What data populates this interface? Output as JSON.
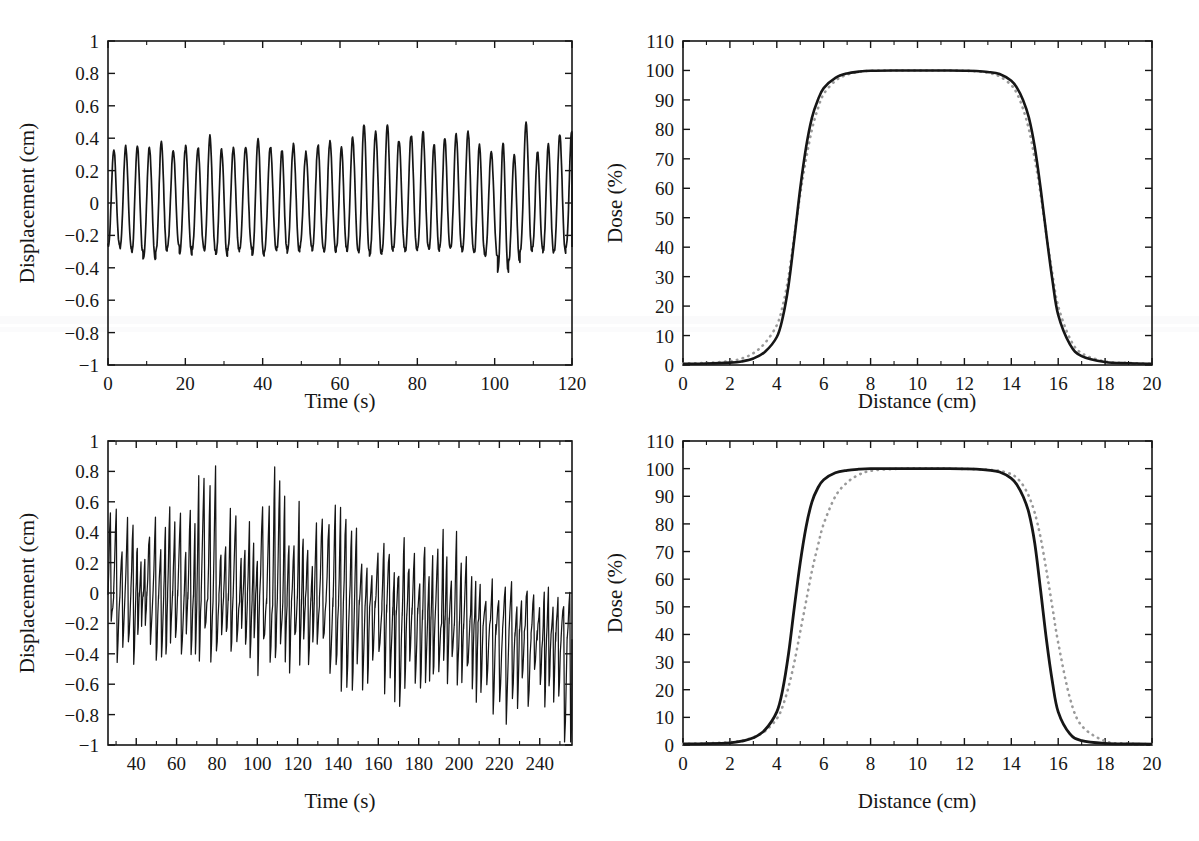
{
  "figure": {
    "background": "#ffffff",
    "ink": "#161616",
    "dotted_color": "#9a9a9a",
    "panel_count": 4
  },
  "panels": [
    {
      "id": "top-left",
      "name": "regular-breathing-trace",
      "chart_data": {
        "type": "line",
        "title": "",
        "xlabel": "Time (s)",
        "ylabel": "Displacement (cm)",
        "xlim": [
          0,
          120
        ],
        "ylim": [
          -1,
          1
        ],
        "xticks": [
          0,
          20,
          40,
          60,
          80,
          100,
          120
        ],
        "xticklabels": [
          "0",
          "20",
          "40",
          "60",
          "80",
          "100",
          "120"
        ],
        "yticks": [
          -1,
          -0.8,
          -0.6,
          -0.4,
          -0.2,
          0,
          0.2,
          0.4,
          0.6,
          0.8,
          1
        ],
        "yticklabels": [
          "−1",
          "−0.8",
          "−0.6",
          "−0.4",
          "−0.2",
          "0",
          "0.2",
          "0.4",
          "0.6",
          "0.8",
          "1"
        ],
        "minor_x_ticks": [
          10,
          30,
          50,
          70,
          90,
          110
        ],
        "grid": false,
        "legend": "none",
        "series": [
          {
            "name": "regular respiratory displacement",
            "style": "solid",
            "color": "#161616",
            "description": "Quasi-periodic breathing waveform, ~35 cycles over 120 s (period approx 3.4 s), sharp positive peaks and broad flat-bottomed troughs.",
            "peak_amplitudes": [
              0.33,
              0.35,
              0.36,
              0.34,
              0.38,
              0.33,
              0.35,
              0.34,
              0.41,
              0.33,
              0.34,
              0.35,
              0.39,
              0.35,
              0.33,
              0.36,
              0.31,
              0.36,
              0.38,
              0.35,
              0.4,
              0.49,
              0.44,
              0.49,
              0.39,
              0.42,
              0.44,
              0.36,
              0.4,
              0.42,
              0.44,
              0.36,
              0.31,
              0.37,
              0.3,
              0.49,
              0.32,
              0.36,
              0.42,
              0.45
            ],
            "trough_amplitudes": [
              -0.26,
              -0.28,
              -0.3,
              -0.35,
              -0.3,
              -0.27,
              -0.31,
              -0.28,
              -0.3,
              -0.32,
              -0.29,
              -0.28,
              -0.33,
              -0.3,
              -0.28,
              -0.3,
              -0.27,
              -0.29,
              -0.3,
              -0.28,
              -0.29,
              -0.3,
              -0.32,
              -0.3,
              -0.28,
              -0.3,
              -0.28,
              -0.29,
              -0.27,
              -0.28,
              -0.3,
              -0.31,
              -0.33,
              -0.42,
              -0.36,
              -0.3,
              -0.28,
              -0.3,
              -0.3,
              -0.28
            ],
            "mean_level": -0.05,
            "max": 0.49,
            "min": -0.42
          }
        ]
      }
    },
    {
      "id": "top-right",
      "name": "dose-profile-regular",
      "chart_data": {
        "type": "line",
        "title": "",
        "xlabel": "Distance (cm)",
        "ylabel": "Dose (%)",
        "xlim": [
          0,
          20
        ],
        "ylim": [
          0,
          110
        ],
        "xticks": [
          0,
          2,
          4,
          6,
          8,
          10,
          12,
          14,
          16,
          18,
          20
        ],
        "xticklabels": [
          "0",
          "2",
          "4",
          "6",
          "8",
          "10",
          "12",
          "14",
          "16",
          "18",
          "20"
        ],
        "yticks": [
          0,
          10,
          20,
          30,
          40,
          50,
          60,
          70,
          80,
          90,
          100,
          110
        ],
        "yticklabels": [
          "0",
          "10",
          "20",
          "30",
          "40",
          "50",
          "60",
          "70",
          "80",
          "90",
          "100",
          "110"
        ],
        "minor_x_ticks": [
          1,
          3,
          5,
          7,
          9,
          11,
          13,
          15,
          17,
          19
        ],
        "grid": false,
        "legend": "none",
        "x": [
          0,
          1,
          2,
          2.5,
          3,
          3.5,
          4,
          4.25,
          4.5,
          4.75,
          5,
          5.25,
          5.5,
          5.75,
          6,
          6.5,
          7,
          7.5,
          8,
          9,
          10,
          11,
          12,
          12.5,
          13,
          13.5,
          14,
          14.25,
          14.5,
          14.75,
          15,
          15.25,
          15.5,
          15.75,
          16,
          16.5,
          17,
          18,
          19,
          20
        ],
        "series": [
          {
            "name": "static dose profile",
            "style": "solid",
            "color": "#161616",
            "values": [
              0.4,
              0.5,
              0.8,
              1.2,
              2.2,
              4.5,
              9.5,
              16,
              27,
              43,
              60,
              74,
              84,
              90,
              94,
              97.5,
              99,
              99.6,
              99.9,
              100,
              100,
              100,
              99.9,
              99.8,
              99.5,
              98.8,
              96.5,
              94,
              90,
              84,
              74,
              60,
              44,
              29,
              17,
              7,
              3,
              1,
              0.6,
              0.4
            ]
          },
          {
            "name": "motion-convolved dose profile",
            "style": "dotted",
            "color": "#9a9a9a",
            "description": "Dotted curve nearly coincident with the solid curve; slightly wider penumbra on both sides.",
            "values": [
              0.5,
              0.7,
              1.3,
              2.2,
              4.0,
              7.5,
              13.5,
              20,
              30,
              44,
              58,
              70,
              80,
              87,
              92,
              96.5,
              98.6,
              99.5,
              99.9,
              100,
              100,
              100,
              99.9,
              99.7,
              99.2,
              98.0,
              95.0,
              92,
              87,
              80,
              70,
              58,
              44,
              31,
              20,
              9,
              4,
              1.2,
              0.7,
              0.4
            ]
          }
        ]
      }
    },
    {
      "id": "bottom-left",
      "name": "irregular-breathing-trace",
      "chart_data": {
        "type": "line",
        "title": "",
        "xlabel": "Time (s)",
        "ylabel": "Displacement (cm)",
        "xlim": [
          26,
          256
        ],
        "ylim": [
          -1,
          1
        ],
        "xticks": [
          40,
          60,
          80,
          100,
          120,
          140,
          160,
          180,
          200,
          220,
          240,
          260
        ],
        "xticklabels": [
          "40",
          "60",
          "80",
          "100",
          "120",
          "140",
          "160",
          "180",
          "200",
          "220",
          "240",
          "260"
        ],
        "yticks": [
          -1,
          -0.8,
          -0.6,
          -0.4,
          -0.2,
          0,
          0.2,
          0.4,
          0.6,
          0.8,
          1
        ],
        "yticklabels": [
          "−1",
          "−0.8",
          "−0.6",
          "−0.4",
          "−0.2",
          "0",
          "0.2",
          "0.4",
          "0.6",
          "0.8",
          "1"
        ],
        "minor_x_ticks": [
          30,
          50,
          70,
          90,
          110,
          130,
          150,
          170,
          190,
          210,
          230,
          250
        ],
        "grid": false,
        "legend": "none",
        "series": [
          {
            "name": "irregular respiratory displacement",
            "style": "solid",
            "color": "#161616",
            "description": "Highly irregular, dense high-frequency trace with strongly varying amplitude and a slow downward baseline drift after t~190 s.",
            "max": 0.87,
            "min": -0.75,
            "baseline_drift": [
              0.0,
              0.0,
              -0.02,
              -0.03,
              -0.05,
              -0.06,
              -0.08,
              -0.12,
              -0.18,
              -0.24,
              -0.28,
              -0.3
            ],
            "envelope_upper": [
              0.61,
              0.42,
              0.45,
              0.57,
              0.55,
              0.87,
              0.52,
              0.48,
              0.75,
              0.75,
              0.52,
              0.7,
              0.55,
              0.42,
              0.47,
              0.42,
              0.46,
              0.61,
              0.35,
              0.26,
              0.33,
              0.22,
              0.33,
              0.25
            ],
            "envelope_lower": [
              -0.43,
              -0.45,
              -0.41,
              -0.38,
              -0.41,
              -0.4,
              -0.49,
              -0.42,
              -0.44,
              -0.43,
              -0.47,
              -0.45,
              -0.56,
              -0.47,
              -0.56,
              -0.51,
              -0.44,
              -0.47,
              -0.58,
              -0.52,
              -0.53,
              -0.55,
              -0.61,
              -0.75
            ]
          }
        ]
      }
    },
    {
      "id": "bottom-right",
      "name": "dose-profile-irregular",
      "chart_data": {
        "type": "line",
        "title": "",
        "xlabel": "Distance (cm)",
        "ylabel": "Dose (%)",
        "xlim": [
          0,
          20
        ],
        "ylim": [
          0,
          110
        ],
        "xticks": [
          0,
          2,
          4,
          6,
          8,
          10,
          12,
          14,
          16,
          18,
          20
        ],
        "xticklabels": [
          "0",
          "2",
          "4",
          "6",
          "8",
          "10",
          "12",
          "14",
          "16",
          "18",
          "20"
        ],
        "yticks": [
          0,
          10,
          20,
          30,
          40,
          50,
          60,
          70,
          80,
          90,
          100,
          110
        ],
        "yticklabels": [
          "0",
          "10",
          "20",
          "30",
          "40",
          "50",
          "60",
          "70",
          "80",
          "90",
          "100",
          "110"
        ],
        "minor_x_ticks": [
          1,
          3,
          5,
          7,
          9,
          11,
          13,
          15,
          17,
          19
        ],
        "grid": false,
        "legend": "none",
        "x": [
          0,
          1,
          2,
          2.5,
          3,
          3.5,
          4,
          4.25,
          4.5,
          4.75,
          5,
          5.25,
          5.5,
          5.75,
          6,
          6.5,
          7,
          7.5,
          8,
          9,
          10,
          11,
          12,
          12.5,
          13,
          13.5,
          14,
          14.25,
          14.5,
          14.75,
          15,
          15.25,
          15.5,
          15.75,
          16,
          16.5,
          17,
          18,
          19,
          20
        ],
        "series": [
          {
            "name": "static dose profile",
            "style": "solid",
            "color": "#161616",
            "values": [
              0.4,
              0.5,
              0.8,
              1.4,
              2.6,
              5.5,
              12,
              20,
              33,
              50,
              66,
              79,
              88,
              93,
              96,
              98.5,
              99.4,
              99.8,
              100,
              100,
              100,
              100,
              99.9,
              99.8,
              99.5,
              98.8,
              96.5,
              94,
              90,
              84,
              73,
              56,
              38,
              23,
              12,
              4,
              1.6,
              0.6,
              0.4,
              0.3
            ]
          },
          {
            "name": "motion-convolved dose profile",
            "style": "dotted",
            "color": "#9a9a9a",
            "description": "Dotted curve markedly shifted and broadened: left penumbra displaced right by about 0.8 cm, right penumbra extended right by about 1.0 cm.",
            "values": [
              0.4,
              0.6,
              1.0,
              1.6,
              2.8,
              5.0,
              9.5,
              14,
              21,
              30,
              41,
              52,
              63,
              72,
              80,
              90,
              95,
              97.8,
              99.2,
              99.9,
              100,
              100,
              99.9,
              99.8,
              99.6,
              99.2,
              98.0,
              96.5,
              94,
              90,
              84,
              75,
              63,
              50,
              37,
              17,
              7,
              1.4,
              0.5,
              0.3
            ]
          }
        ]
      }
    }
  ]
}
